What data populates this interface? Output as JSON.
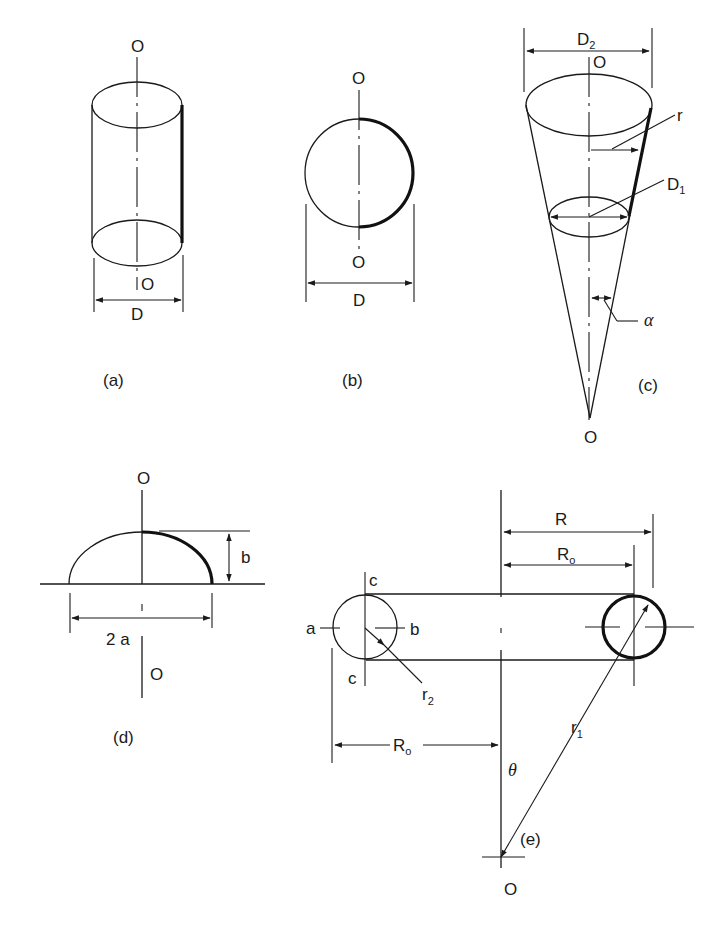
{
  "figure": {
    "panels": [
      {
        "id": "a",
        "caption": "(a)",
        "shape": "cylinder",
        "axis_top": "O",
        "axis_bottom": "O",
        "dimension": "D"
      },
      {
        "id": "b",
        "caption": "(b)",
        "shape": "sphere",
        "axis_top": "O",
        "axis_bottom": "O",
        "dimension": "D"
      },
      {
        "id": "c",
        "caption": "(c)",
        "shape": "cone",
        "axis_top": "O",
        "axis_bottom": "O",
        "dimension_top": "D",
        "dimension_top_sub": "2",
        "dimension_mid": "D",
        "dimension_mid_sub": "1",
        "radius": "r",
        "angle": "α"
      },
      {
        "id": "d",
        "caption": "(d)",
        "shape": "ellipsoidal-dome",
        "axis_top": "O",
        "axis_bottom": "O",
        "height": "b",
        "width": "2 a"
      },
      {
        "id": "e",
        "caption": "(e)",
        "shape": "torus",
        "axis_bottom": "O",
        "outer_radius": "R",
        "mean_radius": "R",
        "mean_radius_sub": "o",
        "point_a": "a",
        "point_b": "b",
        "point_c_top": "c",
        "point_c_bottom": "c",
        "tube_radius": "r",
        "tube_radius_sub": "2",
        "meridian_radius": "r",
        "meridian_radius_sub": "1",
        "angle": "θ",
        "left_dimension": "R",
        "left_dimension_sub": "o"
      }
    ]
  }
}
